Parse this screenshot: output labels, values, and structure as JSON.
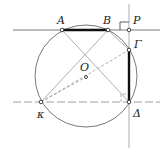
{
  "diagram": {
    "type": "geometry-figure",
    "circle": {
      "center_label": "O"
    },
    "points": {
      "A": "A",
      "B": "B",
      "P": "P",
      "Gamma": "Γ",
      "Delta": "Δ",
      "K": "κ",
      "O": "O"
    },
    "segments_bold": [
      "AB",
      "ΓΔ"
    ],
    "right_angle_at": "P",
    "colors": {
      "stroke": "#555555",
      "bold": "#111111",
      "auxiliary": "#9a9a9a"
    }
  }
}
